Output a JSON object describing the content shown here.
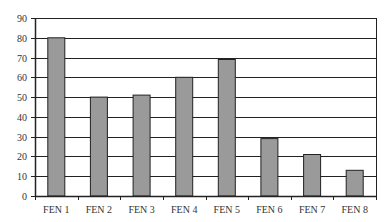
{
  "chart_data": {
    "type": "bar",
    "title": "",
    "xlabel": "",
    "ylabel": "",
    "categories": [
      "FEN 1",
      "FEN 2",
      "FEN 3",
      "FEN 4",
      "FEN 5",
      "FEN 6",
      "FEN 7",
      "FEN 8"
    ],
    "values": [
      80,
      50,
      51,
      60,
      69,
      29,
      21,
      13
    ],
    "ylim": [
      0,
      90
    ],
    "yticks": [
      0,
      10,
      20,
      30,
      40,
      50,
      60,
      70,
      80,
      90
    ],
    "grid": true,
    "legend": null,
    "colors": {
      "bar_fill": "#9a9a9a",
      "bar_stroke": "#222222",
      "grid": "#222222",
      "axis": "#222222",
      "background": "#ffffff"
    }
  }
}
